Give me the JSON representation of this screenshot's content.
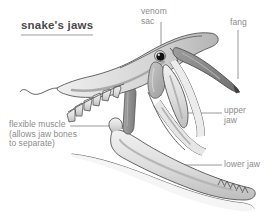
{
  "figure": {
    "title": "snake's jaws",
    "background_color": "#ffffff",
    "title_color": "#4a4a4a",
    "label_color": "#8c8c8c",
    "leader_line_color": "#7d7d7d",
    "outline_color": "#555555",
    "bone_fill_color": "#e4e4e4",
    "shading_color": "#b9b9b9",
    "venom_sac_color": "#a9a9a9",
    "muscle_color": "#8e8e8e",
    "fang_color": "#7a7a7a",
    "eye_color": "#111111"
  },
  "labels": {
    "venom_sac": "venom\nsac",
    "fang": "fang",
    "upper_jaw": "upper\njaw",
    "lower_jaw": "lower jaw",
    "flexible_muscle": "flexible muscle\n(allows jaw bones\nto separate)"
  },
  "parts": [
    {
      "name": "venom-sac",
      "label": "venom sac"
    },
    {
      "name": "fang",
      "label": "fang"
    },
    {
      "name": "upper-jaw",
      "label": "upper jaw"
    },
    {
      "name": "lower-jaw",
      "label": "lower jaw"
    },
    {
      "name": "flexible-muscle",
      "label": "flexible muscle (allows jaw bones to separate)"
    }
  ]
}
